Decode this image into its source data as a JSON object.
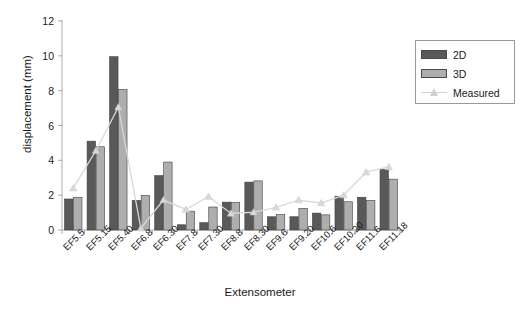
{
  "chart_data": {
    "type": "bar",
    "title": "",
    "xlabel": "Extensometer",
    "ylabel": "displacement (mm)",
    "ylim": [
      0,
      12
    ],
    "yticks": [
      0,
      2,
      4,
      6,
      8,
      10,
      12
    ],
    "grid": false,
    "legend_position": "top-right",
    "categories": [
      "EF5.5",
      "EF5.15",
      "EF5.40",
      "EF6.8",
      "EF6.30",
      "EF7.8",
      "EF7.30",
      "EF8.8",
      "EF8.30",
      "EF9.6",
      "EF9.20",
      "EF10.6",
      "EF10.20",
      "EF11.6",
      "EF11.18"
    ],
    "series": [
      {
        "name": "2D",
        "kind": "bar",
        "color": "#595959",
        "values": [
          1.78,
          5.1,
          9.95,
          1.7,
          3.12,
          0.3,
          0.42,
          1.6,
          2.75,
          0.76,
          0.76,
          0.97,
          1.94,
          1.88,
          3.48
        ]
      },
      {
        "name": "3D",
        "kind": "bar",
        "color": "#aeaeae",
        "values": [
          1.88,
          4.78,
          8.07,
          1.98,
          3.9,
          1.08,
          1.32,
          1.58,
          2.82,
          0.88,
          1.24,
          0.87,
          1.62,
          1.7,
          2.92
        ]
      },
      {
        "name": "Measured",
        "kind": "line",
        "color": "#d9d9d9",
        "marker": "triangle",
        "values": [
          2.4,
          4.55,
          7.05,
          0.1,
          1.72,
          1.18,
          1.92,
          0.95,
          1.02,
          1.3,
          1.72,
          1.55,
          2.0,
          3.32,
          3.62
        ]
      }
    ]
  },
  "legend": {
    "items": [
      {
        "label": "2D",
        "type": "swatch",
        "color": "#595959"
      },
      {
        "label": "3D",
        "type": "swatch",
        "color": "#aeaeae"
      },
      {
        "label": "Measured",
        "type": "line",
        "color": "#d9d9d9"
      }
    ]
  },
  "axes": {
    "y_title": "displacement (mm)",
    "x_title": "Extensometer",
    "y_tick_labels": [
      "12",
      "10",
      "8",
      "6",
      "4",
      "2",
      "0"
    ]
  }
}
